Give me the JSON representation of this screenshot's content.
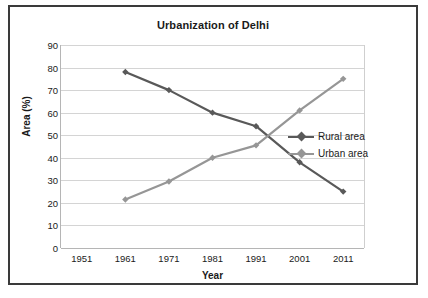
{
  "chart_data": {
    "type": "line",
    "title": "Urbanization of Delhi",
    "xlabel": "Year",
    "ylabel": "Area (%)",
    "categories": [
      "1951",
      "1961",
      "1971",
      "1981",
      "1991",
      "2001",
      "2011"
    ],
    "ylim": [
      0,
      90
    ],
    "ytick_step": 10,
    "yticks": [
      "90",
      "80",
      "70",
      "60",
      "50",
      "40",
      "30",
      "20",
      "10",
      "0"
    ],
    "grid": "horizontal",
    "legend_position": "inside-right",
    "series": [
      {
        "name": "Rural area",
        "color": "#595959",
        "marker": "diamond",
        "x": [
          "1961",
          "1971",
          "1981",
          "1991",
          "2001",
          "2011"
        ],
        "values": [
          78,
          70,
          60,
          54,
          38,
          25
        ]
      },
      {
        "name": "Urban area",
        "color": "#969696",
        "marker": "diamond",
        "x": [
          "1961",
          "1971",
          "1981",
          "1991",
          "2001",
          "2011"
        ],
        "values": [
          21.5,
          29.5,
          40,
          45.5,
          61,
          75
        ]
      }
    ]
  },
  "style": {
    "frame_border_color": "#3a3a3a",
    "gridline_color": "#d4d4d4",
    "background": "#ffffff",
    "text_color": "#1a1a1a"
  }
}
